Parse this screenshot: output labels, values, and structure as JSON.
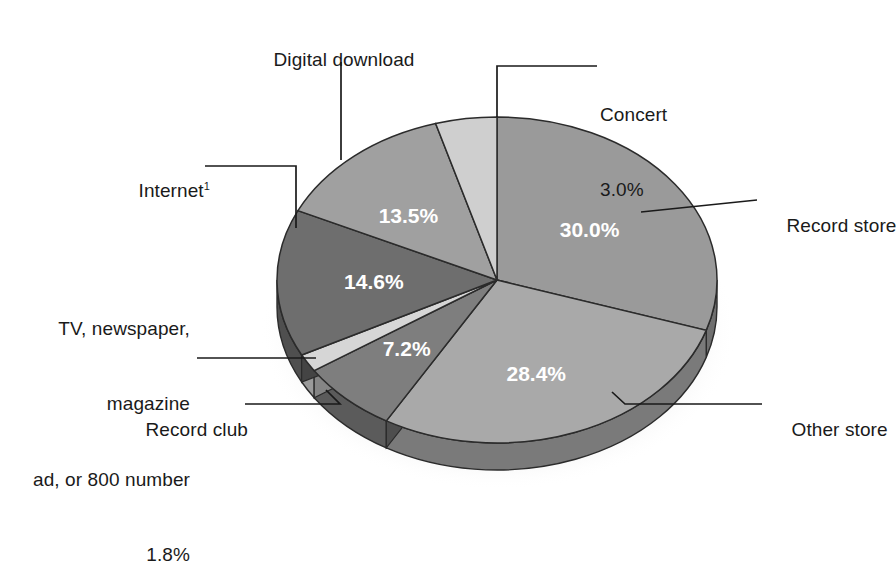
{
  "chart_data": {
    "type": "pie",
    "title": "",
    "subtitle": "",
    "xlabel": "",
    "ylabel": "",
    "legend_position": "callout-labels",
    "grid": false,
    "three_d": true,
    "total": 98.5,
    "units": "percent",
    "categories": [
      "Record store",
      "Other store",
      "Record club",
      "TV, newspaper, magazine ad, or 800 number",
      "Internet",
      "Digital download",
      "Concert"
    ],
    "values": [
      30.0,
      28.4,
      7.2,
      1.8,
      14.6,
      13.5,
      3.0
    ],
    "labels": [
      "30.0%",
      "28.4%",
      "7.2%",
      "1.8%",
      "14.6%",
      "13.5%",
      "3.0%"
    ],
    "colors": [
      "#9a9a9a",
      "#a9a9a9",
      "#7e7e7e",
      "#d6d6d6",
      "#6e6e6e",
      "#a0a0a0",
      "#cfcfcf"
    ],
    "slices": [
      {
        "name": "Record store",
        "value": 30.0,
        "label": "30.0%",
        "color": "#9a9a9a",
        "start_deg": 0,
        "end_deg": 108.0,
        "value_label_inside": true
      },
      {
        "name": "Other store",
        "value": 28.4,
        "label": "28.4%",
        "color": "#a9a9a9",
        "start_deg": 108.0,
        "end_deg": 210.2,
        "value_label_inside": true
      },
      {
        "name": "Record club",
        "value": 7.2,
        "label": "7.2%",
        "color": "#7e7e7e",
        "start_deg": 210.2,
        "end_deg": 236.2,
        "value_label_inside": true
      },
      {
        "name": "TV, newspaper, magazine ad, or 800 number",
        "value": 1.8,
        "label": "1.8%",
        "color": "#d6d6d6",
        "start_deg": 236.2,
        "end_deg": 242.6,
        "value_label_inside": false
      },
      {
        "name": "Internet",
        "value": 14.6,
        "label": "14.6%",
        "color": "#6e6e6e",
        "start_deg": 242.6,
        "end_deg": 295.2,
        "value_label_inside": true
      },
      {
        "name": "Digital download",
        "value": 13.5,
        "label": "13.5%",
        "color": "#a0a0a0",
        "start_deg": 295.2,
        "end_deg": 343.8,
        "value_label_inside": true
      },
      {
        "name": "Concert",
        "value": 3.0,
        "label": "3.0%",
        "color": "#cfcfcf",
        "start_deg": 343.8,
        "end_deg": 360.0,
        "value_label_inside": false
      }
    ]
  },
  "callouts": {
    "digital_download": {
      "label": "Digital download"
    },
    "concert": {
      "label": "Concert",
      "value": "3.0%"
    },
    "internet": {
      "label": "Internet",
      "footnote": "1"
    },
    "record_store": {
      "label": "Record store"
    },
    "other_store": {
      "label": "Other store"
    },
    "record_club": {
      "label": "Record club"
    },
    "tv_ad": {
      "line1": "TV, newspaper,",
      "line2": "magazine",
      "line3": "ad, or 800 number",
      "value": "1.8%"
    }
  },
  "value_labels": {
    "record_store": "30.0%",
    "other_store": "28.4%",
    "record_club": "7.2%",
    "internet": "14.6%",
    "digital_download": "13.5%"
  },
  "style": {
    "background": "#ffffff",
    "text_color": "#1a1a1a",
    "value_text_color": "#ffffff",
    "outline_color": "#2b2b2b",
    "leader_color": "#1a1a1a"
  }
}
